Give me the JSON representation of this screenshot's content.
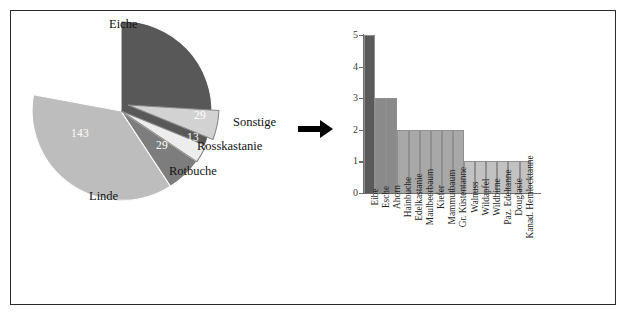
{
  "figure": {
    "border_color": "#2b2b2b",
    "background": "#ffffff"
  },
  "arrow": {
    "name": "right-arrow",
    "color": "#000000"
  },
  "chart_data": [
    {
      "type": "pie",
      "title": "",
      "categories": [
        "Eiche",
        "Linde",
        "Rotbuche",
        "Rosskastanie",
        "Sonstige"
      ],
      "values": [
        221,
        143,
        29,
        13,
        29
      ],
      "labels_outside": [
        "Eiche",
        "Linde",
        "Rotbuche",
        "Rosskastanie",
        "Sonstige"
      ],
      "data_labels": [
        "221",
        "143",
        "29",
        "13",
        "29"
      ],
      "colors": [
        "#585858",
        "#bdbdbd",
        "#7d7d7d",
        "#ededed",
        "#d2d2d2"
      ],
      "exploded": [
        "Sonstige"
      ],
      "legend": "outside-labels",
      "grid": false
    },
    {
      "type": "bar",
      "title": "",
      "xlabel": "",
      "ylabel": "",
      "ylim": [
        0,
        5
      ],
      "yticks": [
        0,
        1,
        2,
        3,
        4,
        5
      ],
      "grid": false,
      "categories": [
        "Eibe",
        "Esche",
        "Ahorn",
        "Hainbuche",
        "Edelkastanie",
        "Maulbeerbaum",
        "Kiefer",
        "Mammutbaum",
        "Gr. Küstentanne",
        "Walnuss",
        "Wildapfel",
        "Wildbirne",
        "Paz. Edeltanne",
        "Douglasie",
        "Kanad. Hemlocktanne"
      ],
      "values": [
        5,
        3,
        3,
        2,
        2,
        2,
        2,
        2,
        2,
        1,
        1,
        1,
        1,
        1,
        1
      ],
      "bar_colors": [
        "#5a5a5a",
        "#8a8a8a",
        "#8a8a8a",
        "#a8a8a8",
        "#a8a8a8",
        "#a8a8a8",
        "#a8a8a8",
        "#a8a8a8",
        "#a8a8a8",
        "#c2c2c2",
        "#c2c2c2",
        "#c2c2c2",
        "#c2c2c2",
        "#c2c2c2",
        "#c2c2c2"
      ]
    }
  ]
}
